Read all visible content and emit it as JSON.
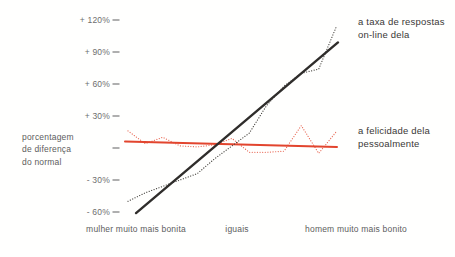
{
  "chart_data": {
    "type": "line",
    "title": "",
    "ylabel_lines": [
      "porcentagem",
      "de diferença",
      "do normal"
    ],
    "x_categories": [
      "mulher muito mais bonita",
      "iguais",
      "homem muito mais bonito"
    ],
    "y_ticks": [
      {
        "label": "+ 120%",
        "value": 120
      },
      {
        "label": "+ 90%",
        "value": 90
      },
      {
        "label": "+ 60%",
        "value": 60
      },
      {
        "label": "+ 30%",
        "value": 30
      },
      {
        "label": "",
        "value": 0
      },
      {
        "label": "- 30%",
        "value": -30
      },
      {
        "label": "- 60%",
        "value": -60
      }
    ],
    "ylim": [
      -67,
      129
    ],
    "grid": false,
    "legend_position": "right-annotations",
    "series": [
      {
        "name": "her-in-person-happiness-data",
        "style": "dotted",
        "color": "#e96c59",
        "values": [
          16,
          4,
          10,
          2,
          1,
          3,
          9,
          -4,
          -4,
          -3,
          21,
          -5,
          15
        ]
      },
      {
        "name": "her-in-person-happiness-trend",
        "style": "solid",
        "color": "#e2452e",
        "trend": {
          "start": 6,
          "end": 1
        }
      },
      {
        "name": "her-online-reply-rate-data",
        "style": "dotted",
        "color": "#46443f",
        "values": [
          -50,
          -42,
          -36,
          -30,
          -24,
          -10,
          2,
          14,
          40,
          58,
          70,
          74,
          113
        ]
      },
      {
        "name": "her-online-reply-rate-trend",
        "style": "solid",
        "color": "#2f2d2b",
        "trend": {
          "start": -61,
          "end": 99
        }
      }
    ],
    "annotations": [
      {
        "lines": [
          "a taxa de respostas",
          "on-line dela"
        ],
        "series": "her-online-reply-rate"
      },
      {
        "lines": [
          "a felicidade dela",
          "pessoalmente"
        ],
        "series": "her-in-person-happiness"
      }
    ],
    "colors": {
      "black_line": "#2f2d2b",
      "red_line": "#e2452e",
      "tick_text": "#6e6e6e",
      "axis_text": "#5d5d5d",
      "annotation_text": "#3a3836"
    }
  }
}
